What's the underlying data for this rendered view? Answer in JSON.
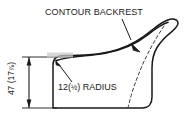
{
  "diagram": {
    "type": "technical-drawing",
    "background_color": "#ffffff",
    "line_color": "#1a1a1a",
    "dashed_line_color": "#3a3a3a",
    "annotations": {
      "title_label": "CONTOUR BACKREST",
      "radius_label_prefix": "12(",
      "radius_label_fraction": "½",
      "radius_label_suffix": ") RADIUS",
      "height_label_prefix": "47 (17",
      "height_label_fraction": "⅞",
      "height_label_suffix": ")"
    },
    "dimensions": {
      "height_mm": 47,
      "height_in": "17 7/8",
      "radius_mm": 12,
      "radius_in": "1/2"
    },
    "leaders": [
      {
        "name": "contour-backrest-leader",
        "from_label": "CONTOUR BACKREST",
        "points_to": "dashed-contour-line"
      },
      {
        "name": "radius-leader",
        "from_label": "12(½) RADIUS",
        "points_to": "rounded-top-left-corner"
      }
    ],
    "dimension_line": {
      "name": "height-dimension",
      "orientation": "vertical",
      "arrows": "both-ends"
    }
  }
}
